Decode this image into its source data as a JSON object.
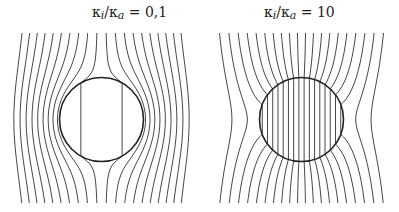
{
  "panels": [
    {
      "title_prefix": "κ",
      "title_sub1": "i",
      "title_mid": "/κ",
      "title_sub2": "a",
      "title_value": " = 0,1",
      "ratio": 0.1,
      "cx": 101.5,
      "cy": 119.5,
      "radius": 42,
      "x_min": 23,
      "x_max": 182,
      "y_min": 33,
      "y_max": 203,
      "line_count": 20
    },
    {
      "title_prefix": "κ",
      "title_sub1": "i",
      "title_mid": "/κ",
      "title_sub2": "a",
      "title_value": " = 10",
      "ratio": 10,
      "cx": 301.5,
      "cy": 119.5,
      "radius": 42,
      "x_min": 221,
      "x_max": 385,
      "y_min": 33,
      "y_max": 203,
      "line_count": 20
    }
  ],
  "colors": {
    "line": "#333333",
    "circle": "#222222"
  }
}
